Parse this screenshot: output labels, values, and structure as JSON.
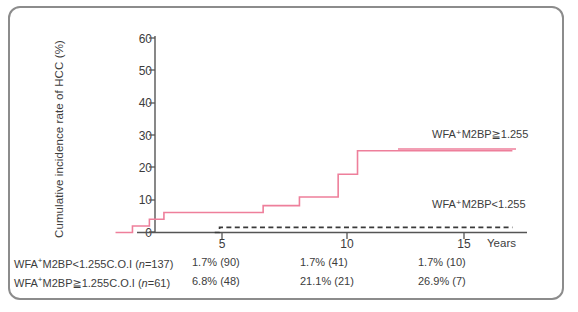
{
  "chart_data": {
    "type": "line",
    "title": "",
    "xlabel": "Years",
    "ylabel": "Cumulative incidence rate of HCC (%)",
    "xlim": [
      0,
      17.5
    ],
    "ylim": [
      0,
      65
    ],
    "yticks": [
      0,
      10,
      20,
      30,
      40,
      50,
      60
    ],
    "xticks": [
      5,
      10,
      15
    ],
    "grid": false,
    "legend_position": "right-inline",
    "series": [
      {
        "name": "WFA+M2BP>=1.255",
        "style": "solid",
        "color": "#ee7f9b",
        "x": [
          0.6,
          1.3,
          1.3,
          2.0,
          2.0,
          2.6,
          2.6,
          6.7,
          6.7,
          8.2,
          8.2,
          9.8,
          9.8,
          10.6,
          10.6,
          17.0
        ],
        "y": [
          0,
          0,
          2.0,
          2.0,
          4.1,
          4.1,
          6.2,
          6.2,
          8.3,
          8.3,
          11.0,
          11.0,
          18.0,
          18.0,
          25.3,
          25.3
        ]
      },
      {
        "name": "WFA+M2BP<1.255",
        "style": "dashed",
        "color": "#3a3a3a",
        "x": [
          4.7,
          4.9,
          4.9,
          17.0
        ],
        "y": [
          0,
          0,
          1.6,
          1.6
        ]
      }
    ]
  },
  "legend": {
    "upper": "WFA⁺M2BP≧1.255",
    "lower": "WFA⁺M2BP<1.255"
  },
  "axis": {
    "y_label": "Cumulative incidence rate of HCC (%)",
    "y_ticks": [
      "60",
      "50",
      "40",
      "30",
      "20",
      "10",
      "0"
    ],
    "x_ticks": [
      "5",
      "10",
      "15"
    ],
    "x_unit": "Years"
  },
  "risk_table": {
    "rows": [
      {
        "label_prefix": "WFA",
        "label_sup": "+",
        "label_main": "M2BP<1.255C.O.I (",
        "label_n_italic": "n",
        "label_n_value": "=137)",
        "v1": "1.7% (90)",
        "v2": "1.7% (41)",
        "v3": "1.7% (10)"
      },
      {
        "label_prefix": "WFA",
        "label_sup": "+",
        "label_main": "M2BP≧1.255C.O.I (",
        "label_n_italic": "n",
        "label_n_value": "=61)",
        "v1": "6.8% (48)",
        "v2": "21.1% (21)",
        "v3": "26.9% (7)"
      }
    ]
  },
  "colors": {
    "pink": "#ee7f9b",
    "dark": "#3a3a3a",
    "axis": "#555555",
    "frame": "#8c8c8c"
  }
}
